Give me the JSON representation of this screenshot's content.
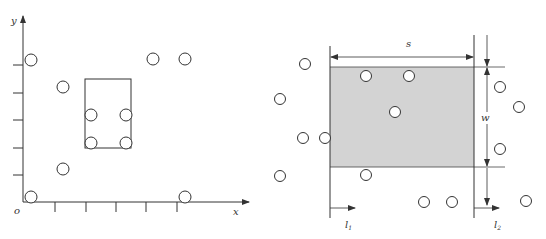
{
  "colors": {
    "line": "#333333",
    "shade": "#d3d3d3",
    "circle_fill": "#ffffff",
    "circle_stroke": "#333333"
  },
  "left_diagram": {
    "axis_labels": {
      "y": "y",
      "x": "x",
      "origin": "o"
    },
    "circles": [
      {
        "cx": 31,
        "cy": 60
      },
      {
        "cx": 63,
        "cy": 87
      },
      {
        "cx": 153,
        "cy": 59
      },
      {
        "cx": 185,
        "cy": 59
      },
      {
        "cx": 91,
        "cy": 115
      },
      {
        "cx": 126,
        "cy": 115
      },
      {
        "cx": 91,
        "cy": 143
      },
      {
        "cx": 126,
        "cy": 143
      },
      {
        "cx": 63,
        "cy": 169
      },
      {
        "cx": 31,
        "cy": 197
      },
      {
        "cx": 185,
        "cy": 197
      }
    ],
    "window_rect": {
      "x": 85,
      "y": 79,
      "w": 46,
      "h": 69
    },
    "y_ticks": [
      65,
      93,
      120,
      148,
      175
    ],
    "x_ticks": [
      55,
      86,
      116,
      146,
      177
    ]
  },
  "right_diagram": {
    "labels": {
      "width_label": "s",
      "height_label": "w",
      "l1_main": "l",
      "l1_sub": "1",
      "l2_main": "l",
      "l2_sub": "2"
    },
    "shaded_rect": {
      "x": 330,
      "y": 67,
      "w": 144,
      "h": 100
    },
    "circles": [
      {
        "cx": 305,
        "cy": 64
      },
      {
        "cx": 280,
        "cy": 99
      },
      {
        "cx": 303,
        "cy": 138
      },
      {
        "cx": 325,
        "cy": 138
      },
      {
        "cx": 280,
        "cy": 176
      },
      {
        "cx": 366,
        "cy": 76
      },
      {
        "cx": 409,
        "cy": 76
      },
      {
        "cx": 395,
        "cy": 112
      },
      {
        "cx": 366,
        "cy": 175
      },
      {
        "cx": 424,
        "cy": 202
      },
      {
        "cx": 452,
        "cy": 202
      },
      {
        "cx": 500,
        "cy": 87
      },
      {
        "cx": 519,
        "cy": 107
      },
      {
        "cx": 500,
        "cy": 149
      },
      {
        "cx": 526,
        "cy": 201
      }
    ]
  }
}
